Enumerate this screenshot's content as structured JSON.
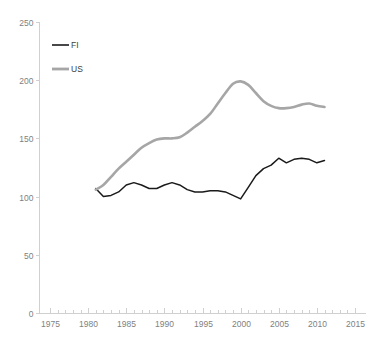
{
  "chart_data": {
    "type": "line",
    "title": "",
    "subtitle": "",
    "xlabel": "",
    "ylabel": "",
    "xlim": [
      1975,
      2015
    ],
    "ylim": [
      0,
      250
    ],
    "grid": false,
    "legend_position": "top-left",
    "x_ticks": [
      1975,
      1980,
      1985,
      1990,
      1995,
      2000,
      2005,
      2010,
      2015
    ],
    "y_ticks": [
      0,
      50,
      100,
      150,
      200,
      250
    ],
    "x_minor_tick_step": 1,
    "x": [
      1981,
      1982,
      1983,
      1984,
      1985,
      1986,
      1987,
      1988,
      1989,
      1990,
      1991,
      1992,
      1993,
      1994,
      1995,
      1996,
      1997,
      1998,
      1999,
      2000,
      2001,
      2002,
      2003,
      2004,
      2005,
      2006,
      2007,
      2008,
      2009,
      2010,
      2011
    ],
    "series": [
      {
        "name": "FI",
        "color": "#1a1a1a",
        "values": [
          107,
          100,
          101,
          104,
          110,
          112,
          110,
          107,
          107,
          110,
          112,
          110,
          106,
          104,
          104,
          105,
          105,
          104,
          101,
          98,
          108,
          118,
          124,
          127,
          133,
          129,
          132,
          133,
          132,
          129,
          131
        ]
      },
      {
        "name": "US",
        "color": "#a6a6a6",
        "values": [
          106,
          110,
          117,
          124,
          130,
          136,
          142,
          146,
          149,
          150,
          150,
          151,
          155,
          160,
          165,
          171,
          180,
          189,
          197,
          199,
          196,
          189,
          182,
          178,
          176,
          176,
          177,
          179,
          180,
          178,
          177
        ]
      }
    ]
  },
  "legend": {
    "entries": [
      {
        "label": "FI",
        "color": "#1a1a1a"
      },
      {
        "label": "US",
        "color": "#a6a6a6"
      }
    ]
  },
  "axes": {
    "y_tick_labels": [
      "250",
      "200",
      "150",
      "100",
      "50",
      "0"
    ],
    "x_tick_labels": [
      "1975",
      "1980",
      "1985",
      "1990",
      "1995",
      "2000",
      "2005",
      "2010",
      "2015"
    ]
  }
}
